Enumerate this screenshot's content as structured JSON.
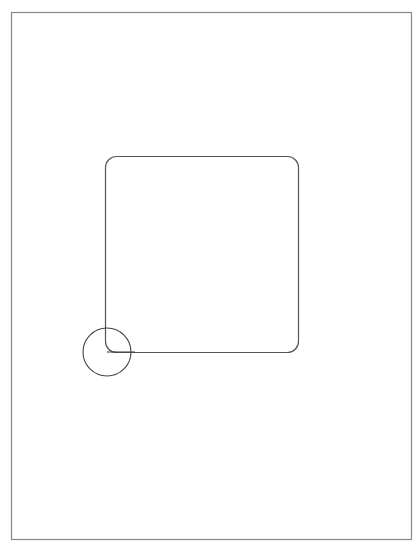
{
  "canvas": {
    "page": {
      "x": 11,
      "y": 12,
      "width": 400,
      "height": 527,
      "stroke": "#888888"
    },
    "rounded_rect": {
      "x": 105.5,
      "y": 156.5,
      "width": 193,
      "height": 196,
      "rx": 11,
      "stroke": "#555555"
    },
    "circle": {
      "cx": 107,
      "cy": 352,
      "r": 24,
      "stroke": "#444444"
    },
    "handle_line": {
      "x1": 107,
      "y1": 352,
      "x2": 135,
      "y2": 352,
      "stroke": "#444444"
    }
  }
}
